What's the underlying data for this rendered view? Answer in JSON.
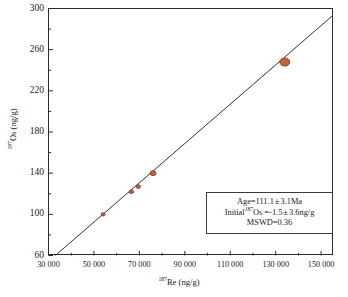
{
  "chart_data": {
    "type": "scatter",
    "title": "",
    "xlabel": "187Re (ng/g)",
    "ylabel": "187Os (ng/g)",
    "xlim": [
      30000,
      155000
    ],
    "ylim": [
      60,
      300
    ],
    "grid": false,
    "legend": null,
    "x_ticks": [
      30000,
      50000,
      70000,
      90000,
      110000,
      130000,
      150000
    ],
    "x_tick_labels": [
      "30 000",
      "50 000",
      "70 000",
      "90 000",
      "110 000",
      "130 000",
      "150 000"
    ],
    "x_minor_ticks": [
      40000,
      60000,
      80000,
      100000,
      120000,
      140000
    ],
    "y_ticks": [
      60,
      100,
      140,
      180,
      220,
      260,
      300
    ],
    "y_tick_labels": [
      "60",
      "100",
      "140",
      "180",
      "220",
      "260",
      "300"
    ],
    "y_minor_ticks": [
      80,
      120,
      160,
      200,
      240,
      280
    ],
    "series": [
      {
        "name": "Re-Os isochron data",
        "marker": "circle",
        "color": "#c4613c",
        "edge_color": "#7a3a22",
        "x": [
          54000,
          66500,
          69500,
          76000,
          134000
        ],
        "y": [
          100,
          122,
          127,
          140,
          248
        ],
        "sizes": [
          4,
          4.5,
          4.5,
          6,
          10
        ]
      }
    ],
    "fit_line": {
      "name": "isochron regression line",
      "color": "#333333",
      "x_start": 33000,
      "y_start": 60,
      "x_end": 155000,
      "y_end": 293
    }
  },
  "axes": {
    "x_title_prefix": "187",
    "x_title_main": "Re (ng/g)",
    "y_title_prefix": "187",
    "y_title_main": "Os (ng/g)"
  },
  "stats_box": {
    "age_label": "Age=",
    "age_value": "111.1",
    "age_pm": "±",
    "age_error": "3.1Ma",
    "initial_label": "Initial",
    "initial_sup": "187",
    "initial_isotope": "Os =",
    "initial_value": "-1.5",
    "initial_pm": "±",
    "initial_error": "3.6ng/g",
    "mswd": "MSWD=0.36"
  },
  "colors": {
    "marker_fill": "#c4613c",
    "marker_edge": "#7a3a22",
    "line": "#333333",
    "frame": "#2b2b2b",
    "background": "#ffffff"
  }
}
